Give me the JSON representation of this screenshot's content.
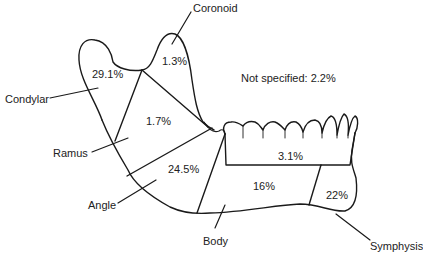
{
  "diagram": {
    "note": "Not specified: 2.2%",
    "regions": [
      {
        "id": "coronoid",
        "label": "Coronoid",
        "percent": "1.3%"
      },
      {
        "id": "condylar",
        "label": "Condylar",
        "percent": "29.1%"
      },
      {
        "id": "ramus",
        "label": "Ramus",
        "percent": "1.7%"
      },
      {
        "id": "angle",
        "label": "Angle",
        "percent": "24.5%"
      },
      {
        "id": "body",
        "label": "Body",
        "percent": "16%"
      },
      {
        "id": "symphysis",
        "label": "Symphysis",
        "percent": "22%"
      },
      {
        "id": "alveolar",
        "label": "",
        "percent": "3.1%"
      }
    ],
    "colors": {
      "line": "#1a1a1a",
      "text": "#222222",
      "background": "#ffffff"
    }
  }
}
